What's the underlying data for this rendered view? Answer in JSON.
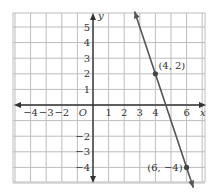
{
  "chart_data": {
    "type": "line",
    "title": "",
    "xlabel": "x",
    "ylabel": "y",
    "xlim": [
      -5,
      7
    ],
    "ylim": [
      -5,
      6
    ],
    "grid": true,
    "x_ticks": [
      "-4",
      "-3",
      "-2",
      "1",
      "2",
      "3",
      "4",
      "6"
    ],
    "y_ticks": [
      "5",
      "4",
      "3",
      "2",
      "1",
      "-2",
      "-3",
      "-4"
    ],
    "origin_label": "O",
    "series": [
      {
        "name": "line",
        "points": [
          [
            4,
            2
          ],
          [
            6,
            -4
          ]
        ],
        "slope": -3,
        "color": "#555555"
      }
    ],
    "annotations": [
      {
        "text": "(4, 2)",
        "x": 4,
        "y": 2
      },
      {
        "text": "(6, −4)",
        "x": 6,
        "y": -4
      }
    ]
  }
}
